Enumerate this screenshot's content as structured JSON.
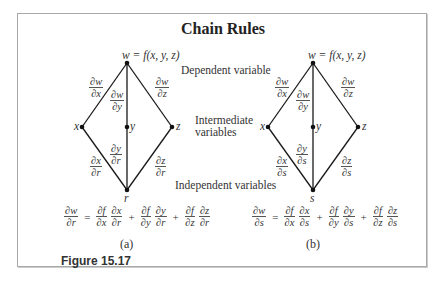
{
  "title": "Chain Rules",
  "labels": {
    "dependent": "Dependent variable",
    "intermediate_line1": "Intermediate",
    "intermediate_line2": "variables",
    "independent": "Independent variables"
  },
  "diagrams": [
    {
      "id": "a",
      "top": "w = f(x,  y,  z)",
      "nodes": {
        "x": "x",
        "y": "y",
        "z": "z",
        "bottom": "r"
      },
      "upper_edges": {
        "wx": {
          "num": "∂w",
          "den": "∂x"
        },
        "wy": {
          "num": "∂w",
          "den": "∂y"
        },
        "wz": {
          "num": "∂w",
          "den": "∂z"
        }
      },
      "lower_edges": {
        "xr": {
          "num": "∂x",
          "den": "∂r"
        },
        "yr": {
          "num": "∂y",
          "den": "∂r"
        },
        "zr": {
          "num": "∂z",
          "den": "∂r"
        }
      },
      "formula": {
        "lhs": {
          "num": "∂w",
          "den": "∂r"
        },
        "eq": "=",
        "terms": [
          {
            "a": {
              "num": "∂f",
              "den": "∂x"
            },
            "b": {
              "num": "∂x",
              "den": "∂r"
            }
          },
          {
            "a": {
              "num": "∂f",
              "den": "∂y"
            },
            "b": {
              "num": "∂y",
              "den": "∂r"
            }
          },
          {
            "a": {
              "num": "∂f",
              "den": "∂z"
            },
            "b": {
              "num": "∂z",
              "den": "∂r"
            }
          }
        ],
        "plus": "+"
      },
      "caption": "(a)"
    },
    {
      "id": "b",
      "top": "w = f(x,  y,  z)",
      "nodes": {
        "x": "x",
        "y": "y",
        "z": "z",
        "bottom": "s"
      },
      "upper_edges": {
        "wx": {
          "num": "∂w",
          "den": "∂x"
        },
        "wy": {
          "num": "∂w",
          "den": "∂y"
        },
        "wz": {
          "num": "∂w",
          "den": "∂z"
        }
      },
      "lower_edges": {
        "xr": {
          "num": "∂x",
          "den": "∂s"
        },
        "yr": {
          "num": "∂y",
          "den": "∂s"
        },
        "zr": {
          "num": "∂z",
          "den": "∂s"
        }
      },
      "formula": {
        "lhs": {
          "num": "∂w",
          "den": "∂s"
        },
        "eq": "=",
        "terms": [
          {
            "a": {
              "num": "∂f",
              "den": "∂x"
            },
            "b": {
              "num": "∂x",
              "den": "∂s"
            }
          },
          {
            "a": {
              "num": "∂f",
              "den": "∂y"
            },
            "b": {
              "num": "∂y",
              "den": "∂s"
            }
          },
          {
            "a": {
              "num": "∂f",
              "den": "∂z"
            },
            "b": {
              "num": "∂z",
              "den": "∂s"
            }
          }
        ],
        "plus": "+"
      },
      "caption": "(b)"
    }
  ],
  "figure_label": "Figure 15.17",
  "colors": {
    "line": "#1a1a1a",
    "frame": "#a8a8a8",
    "text": "#333333"
  }
}
